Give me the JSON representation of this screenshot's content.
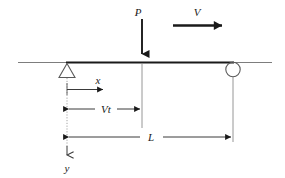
{
  "figure": {
    "type": "engineering-beam-diagram",
    "background_color": "#ffffff",
    "line_color": "#1a1a1a",
    "thin_line_color": "#6e6e6e",
    "labels": {
      "load": "P",
      "velocity": "V",
      "x_axis": "x",
      "y_axis": "y",
      "travelled_distance": "Vt",
      "span_length": "L"
    },
    "supports": {
      "left": {
        "kind": "pin-support-triangle",
        "label": ""
      },
      "right": {
        "kind": "roller-support-circle",
        "label": ""
      }
    },
    "dimensions": [
      {
        "name": "Vt",
        "from": "left-support",
        "to": "load-position"
      },
      {
        "name": "L",
        "from": "left-support",
        "to": "right-support"
      }
    ],
    "arrows": [
      {
        "name": "P",
        "direction": "down",
        "style": "thick",
        "meaning": "concentrated load"
      },
      {
        "name": "V",
        "direction": "right",
        "style": "thick",
        "meaning": "load travel velocity"
      },
      {
        "name": "x",
        "direction": "right",
        "style": "thin",
        "meaning": "coordinate axis"
      },
      {
        "name": "y",
        "direction": "down",
        "style": "thin",
        "meaning": "coordinate axis"
      }
    ]
  }
}
